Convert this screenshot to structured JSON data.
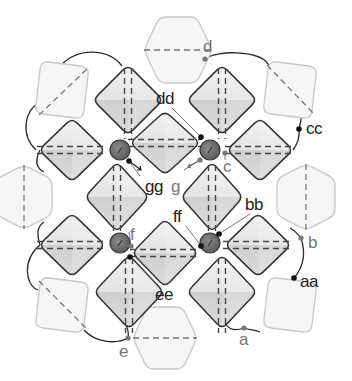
{
  "diagram": {
    "colors": {
      "background": "#ffffff",
      "dark_outline": "#333333",
      "pale_outline": "#c8c8c8",
      "pale_fill": "#f6f6f6",
      "octa_light": "#ececec",
      "octa_dark": "#c9c9c9",
      "tetra_fill": "#6e6e6e",
      "label_dark": "#222222",
      "label_gray": "#777777",
      "connector": "#2a2a2a"
    },
    "tetrahedral_sites": [
      {
        "id": "t1",
        "cx": 120,
        "cy": 150,
        "r": 10
      },
      {
        "id": "t2",
        "cx": 210,
        "cy": 150,
        "r": 10
      },
      {
        "id": "t3",
        "cx": 120,
        "cy": 243,
        "r": 10
      },
      {
        "id": "t4",
        "cx": 210,
        "cy": 243,
        "r": 10
      }
    ],
    "octahedra": [
      {
        "id": "o-top-left",
        "cx": 128,
        "cy": 100,
        "w": 70,
        "h": 70,
        "orient": "vertical"
      },
      {
        "id": "o-top-right",
        "cx": 222,
        "cy": 100,
        "w": 70,
        "h": 70,
        "orient": "vertical"
      },
      {
        "id": "o-left-upper",
        "cx": 72,
        "cy": 150,
        "w": 66,
        "h": 64,
        "orient": "horizontal"
      },
      {
        "id": "o-center-upper",
        "cx": 165,
        "cy": 143,
        "w": 70,
        "h": 64,
        "orient": "horizontal"
      },
      {
        "id": "o-right-upper",
        "cx": 260,
        "cy": 150,
        "w": 66,
        "h": 64,
        "orient": "horizontal"
      },
      {
        "id": "o-mid-left",
        "cx": 117,
        "cy": 197,
        "w": 64,
        "h": 70,
        "orient": "vertical"
      },
      {
        "id": "o-mid-right",
        "cx": 212,
        "cy": 197,
        "w": 62,
        "h": 70,
        "orient": "vertical"
      },
      {
        "id": "o-left-lower",
        "cx": 72,
        "cy": 245,
        "w": 66,
        "h": 64,
        "orient": "horizontal"
      },
      {
        "id": "o-center-lower",
        "cx": 165,
        "cy": 253,
        "w": 66,
        "h": 68,
        "orient": "horizontal"
      },
      {
        "id": "o-right-lower",
        "cx": 258,
        "cy": 245,
        "w": 66,
        "h": 64,
        "orient": "horizontal"
      },
      {
        "id": "o-bottom-left",
        "cx": 129,
        "cy": 292,
        "w": 70,
        "h": 74,
        "orient": "vertical"
      },
      {
        "id": "o-bottom-right",
        "cx": 222,
        "cy": 292,
        "w": 70,
        "h": 74,
        "orient": "vertical"
      }
    ],
    "pale_octahedra": [
      {
        "id": "p-top",
        "cx": 178,
        "cy": 50,
        "w": 68,
        "h": 66,
        "shape": "hex-h"
      },
      {
        "id": "p-top-left",
        "cx": 62,
        "cy": 90,
        "w": 54,
        "h": 58,
        "shape": "square-diag"
      },
      {
        "id": "p-top-right",
        "cx": 290,
        "cy": 90,
        "w": 54,
        "h": 58,
        "shape": "square-diag2"
      },
      {
        "id": "p-left",
        "cx": 24,
        "cy": 197,
        "w": 56,
        "h": 64,
        "shape": "hex-v"
      },
      {
        "id": "p-right",
        "cx": 306,
        "cy": 197,
        "w": 58,
        "h": 66,
        "shape": "hex-v"
      },
      {
        "id": "p-bottom-left",
        "cx": 62,
        "cy": 305,
        "w": 54,
        "h": 56,
        "shape": "square-diag2"
      },
      {
        "id": "p-bottom-right",
        "cx": 290,
        "cy": 305,
        "w": 54,
        "h": 56,
        "shape": "square-plain"
      },
      {
        "id": "p-bottom",
        "cx": 165,
        "cy": 338,
        "w": 64,
        "h": 62,
        "shape": "hex-h"
      }
    ],
    "labels": [
      {
        "id": "d",
        "text": "d",
        "x": 203,
        "y": 52,
        "color": "gray"
      },
      {
        "id": "dd",
        "text": "dd",
        "x": 156,
        "y": 104,
        "color": "dark"
      },
      {
        "id": "cc",
        "text": "cc",
        "x": 306,
        "y": 134,
        "color": "dark"
      },
      {
        "id": "c",
        "text": "c",
        "x": 223,
        "y": 172,
        "color": "gray"
      },
      {
        "id": "gg",
        "text": "gg",
        "x": 145,
        "y": 192,
        "color": "dark"
      },
      {
        "id": "g",
        "text": "g",
        "x": 171,
        "y": 192,
        "color": "gray"
      },
      {
        "id": "bb",
        "text": "bb",
        "x": 245,
        "y": 210,
        "color": "dark"
      },
      {
        "id": "ff",
        "text": "ff",
        "x": 173,
        "y": 222,
        "color": "dark"
      },
      {
        "id": "f",
        "text": "f",
        "x": 130,
        "y": 240,
        "color": "gray"
      },
      {
        "id": "b",
        "text": "b",
        "x": 308,
        "y": 248,
        "color": "gray"
      },
      {
        "id": "ee",
        "text": "ee",
        "x": 155,
        "y": 300,
        "color": "dark"
      },
      {
        "id": "aa",
        "text": "aa",
        "x": 300,
        "y": 287,
        "color": "dark"
      },
      {
        "id": "a",
        "text": "a",
        "x": 239,
        "y": 345,
        "color": "gray"
      },
      {
        "id": "e",
        "text": "e",
        "x": 119,
        "y": 357,
        "color": "gray"
      }
    ],
    "atom_points": [
      {
        "id": "pt-d",
        "x": 205,
        "y": 59,
        "kind": "gray"
      },
      {
        "id": "pt-dd",
        "x": 201,
        "y": 137,
        "kind": "dark"
      },
      {
        "id": "pt-cc",
        "x": 299,
        "y": 129,
        "kind": "dark"
      },
      {
        "id": "pt-c",
        "x": 225,
        "y": 153,
        "kind": "gray"
      },
      {
        "id": "pt-gg",
        "x": 129,
        "y": 161,
        "kind": "dark"
      },
      {
        "id": "pt-g",
        "x": 200,
        "y": 160,
        "kind": "gray"
      },
      {
        "id": "pt-bb",
        "x": 219,
        "y": 234,
        "kind": "dark"
      },
      {
        "id": "pt-ff",
        "x": 201,
        "y": 246,
        "kind": "dark"
      },
      {
        "id": "pt-f",
        "x": 131,
        "y": 246,
        "kind": "gray"
      },
      {
        "id": "pt-ee",
        "x": 130,
        "y": 257,
        "kind": "dark"
      },
      {
        "id": "pt-b",
        "x": 301,
        "y": 238,
        "kind": "gray"
      },
      {
        "id": "pt-aa",
        "x": 294,
        "y": 278,
        "kind": "dark"
      },
      {
        "id": "pt-a",
        "x": 244,
        "y": 328,
        "kind": "gray"
      },
      {
        "id": "pt-e",
        "x": 128,
        "y": 338,
        "kind": "gray"
      }
    ]
  }
}
